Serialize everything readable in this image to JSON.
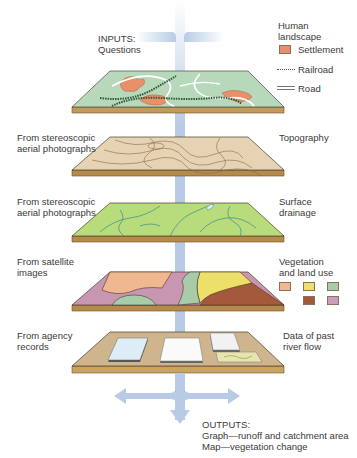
{
  "diagram": {
    "inputs": {
      "heading": "INPUTS:",
      "text": "Questions"
    },
    "outputs": {
      "heading": "OUTPUTS:",
      "lines": [
        "Graph—runoff and catchment area",
        "Map—vegetation change"
      ]
    },
    "layers": [
      {
        "id": "human-landscape",
        "source": [],
        "name": [
          "Human",
          "landscape"
        ],
        "fill": "#b8d8bc",
        "legend": [
          {
            "label": "Settlement",
            "type": "swatch",
            "color": "#e8906a"
          },
          {
            "label": "Railroad",
            "type": "railroad"
          },
          {
            "label": "Road",
            "type": "road"
          }
        ]
      },
      {
        "id": "topography",
        "source": [
          "From stereoscopic",
          "aerial photographs"
        ],
        "name": [
          "Topography"
        ],
        "fill": "#e6d3b4"
      },
      {
        "id": "surface-drainage",
        "source": [
          "From stereoscopic",
          "aerial photographs"
        ],
        "name": [
          "Surface",
          "drainage"
        ],
        "fill": "#b8dc7c"
      },
      {
        "id": "vegetation",
        "source": [
          "From satellite",
          "images"
        ],
        "name": [
          "Vegetation",
          "and land use"
        ],
        "fill": "#c896b0",
        "legend_colors": [
          "#efb890",
          "#ecdf6a",
          "#a8cca8",
          "#a4583c",
          "#cc9cb8"
        ]
      },
      {
        "id": "river-flow",
        "source": [
          "From agency",
          "records"
        ],
        "name": [
          "Data of past",
          "river flow"
        ],
        "fill": "#cfb58e"
      }
    ],
    "colors": {
      "arrow": "#b7cbe4",
      "slab_edge": "#b58b4c",
      "outline": "#4a3a28"
    }
  }
}
